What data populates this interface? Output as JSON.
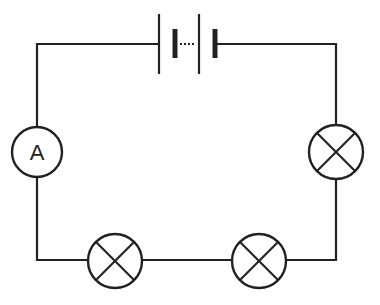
{
  "diagram": {
    "type": "circuit",
    "colors": {
      "stroke": "#222222",
      "background": "#ffffff"
    },
    "components": [
      {
        "id": "battery",
        "kind": "battery-multi-cell",
        "cells_shown": 2,
        "position": "top"
      },
      {
        "id": "ammeter",
        "kind": "ammeter",
        "label": "A",
        "position": "left"
      },
      {
        "id": "lamp1",
        "kind": "lamp",
        "position": "right"
      },
      {
        "id": "lamp2",
        "kind": "lamp",
        "position": "bottom-left"
      },
      {
        "id": "lamp3",
        "kind": "lamp",
        "position": "bottom-right"
      }
    ],
    "ammeter_label": "A",
    "connection": "series"
  }
}
